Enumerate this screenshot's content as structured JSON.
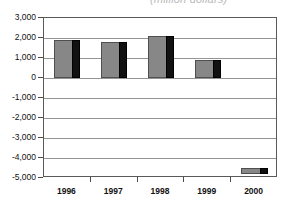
{
  "caption": {
    "text": "(million dollars)",
    "visible_fraction": "cropped at top edge"
  },
  "chart_data": {
    "type": "bar",
    "title": "",
    "subtitle": "(million dollars)",
    "xlabel": "",
    "ylabel": "",
    "categories": [
      "1996",
      "1997",
      "1998",
      "1999",
      "2000"
    ],
    "values": [
      1900,
      1780,
      2100,
      880,
      -4800
    ],
    "series": [
      {
        "name": "Balance",
        "values": [
          1900,
          1780,
          2100,
          880,
          -4800
        ]
      }
    ],
    "ylim": [
      -5000,
      3000
    ],
    "ytick_labels": [
      "3,000",
      "2,000",
      "1,000",
      "0",
      "-1,000",
      "-2,000",
      "-3,000",
      "-4,000",
      "-5,000"
    ],
    "ytick_values": [
      3000,
      2000,
      1000,
      0,
      -1000,
      -2000,
      -3000,
      -4000,
      -5000
    ],
    "grid": true,
    "legend": "none",
    "bar_face_color": "#878787",
    "bar_side_color": "#111111",
    "gridline_color": "#949494",
    "frame_color": "#5a5a5a",
    "plot_background": "#ffffff",
    "note_2000": "2000 bar rendered as a short truncated bar near the bottom of the plot area"
  }
}
